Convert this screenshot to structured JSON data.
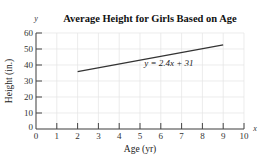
{
  "chart_data": {
    "type": "line",
    "title": "Average Height for Girls Based on Age",
    "xlabel": "Age (yr)",
    "ylabel": "Height (in.)",
    "x_axis_var": "x",
    "y_axis_var": "y",
    "xlim": [
      0,
      10
    ],
    "ylim": [
      0,
      60
    ],
    "xticks": [
      0,
      1,
      2,
      3,
      4,
      5,
      6,
      7,
      8,
      9,
      10
    ],
    "yticks": [
      0,
      10,
      20,
      30,
      40,
      50,
      60
    ],
    "grid": true,
    "series": [
      {
        "name": "y = 2.4x + 31",
        "x": [
          2,
          9
        ],
        "y": [
          35.8,
          52.6
        ],
        "color": "#333333"
      }
    ],
    "annotations": [
      {
        "text": "y = 2.4x + 31",
        "x": 5.3,
        "y": 41
      }
    ]
  }
}
